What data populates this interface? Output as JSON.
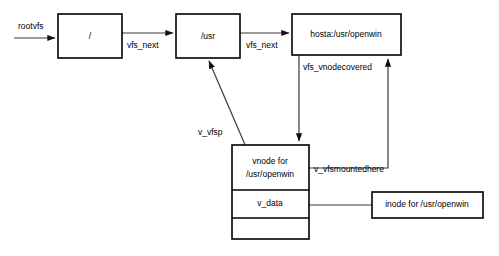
{
  "diagram": {
    "background_color": "#ffffff",
    "line_color": "#3a3a3a",
    "box_border_color": "#000000",
    "text_color": "#000000",
    "boxes": {
      "root_vfs": {
        "label": "/"
      },
      "usr_vfs": {
        "label": "/usr"
      },
      "openwin_vfs": {
        "label": "hosta:/usr/openwin"
      },
      "vnode": {
        "row1_line1": "vnode for",
        "row1_line2": "/usr/openwin",
        "row2": "v_data",
        "row3": ""
      },
      "inode": {
        "label": "inode for /usr/openwin"
      }
    },
    "edges": {
      "rootvfs": "rootvfs",
      "vfs_next_1": "vfs_next",
      "vfs_next_2": "vfs_next",
      "vfs_vnodecovered": "vfs_vnodecovered",
      "v_vfsmountedhere": "v_vfsmountedhere",
      "v_vfsp": "v_vfsp"
    }
  }
}
